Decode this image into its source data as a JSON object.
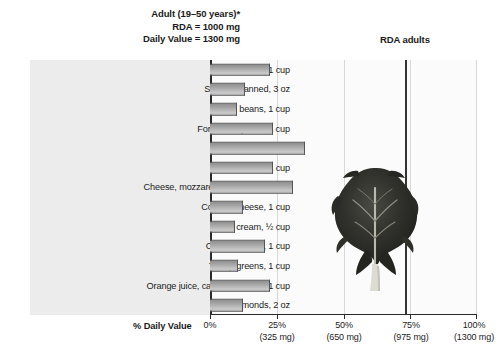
{
  "header": {
    "line1": "Adult (19–50 years)*",
    "line2": "RDA = 1000 mg",
    "line3": "Daily Value = 1300 mg",
    "rda_marker_label": "RDA adults"
  },
  "axis": {
    "title": "% Daily Value",
    "ticks": [
      {
        "pct": "0%",
        "mg": ""
      },
      {
        "pct": "25%",
        "mg": "(325 mg)"
      },
      {
        "pct": "50%",
        "mg": "(650 mg)"
      },
      {
        "pct": "75%",
        "mg": "(975 mg)"
      },
      {
        "pct": "100%",
        "mg": "(1300 mg)"
      }
    ]
  },
  "colors": {
    "label_panel": "#ececec",
    "plot_bg": "#fbfbfb",
    "axis": "#2b2b2b",
    "gridline": "#d8d8d8",
    "rda_line": "#333333",
    "bar_dark": "#8e8e8e",
    "bar_light": "#c9c9c9",
    "bar_outline": "#555555",
    "text": "#1c1c1c"
  },
  "image": {
    "greens_photo_alt": "leafy-greens-photo"
  },
  "chart_data": {
    "type": "bar",
    "xlabel": "% Daily Value",
    "ylabel": "",
    "orientation": "horizontal",
    "xlim": [
      0,
      100
    ],
    "xticks": [
      0,
      25,
      50,
      75,
      100
    ],
    "xtick_labels": [
      "0%",
      "25%",
      "50%",
      "75%",
      "100%"
    ],
    "xtick_sublabels": [
      "",
      "(325 mg)",
      "(650 mg)",
      "(975 mg)",
      "(1300 mg)"
    ],
    "grid": true,
    "legend": false,
    "daily_value_mg": 1300,
    "rda_mg": 1000,
    "rda_marker_pct": 76.9,
    "annotations": [
      "Adult (19–50 years)*",
      "RDA = 1000 mg",
      "Daily Value = 1300 mg",
      "RDA adults"
    ],
    "categories": [
      "Tofu, 1 cup",
      "Salmon, canned, 3 oz",
      "Baked beans, 1 cup",
      "Fortified soy milk, 1 cup",
      "Yogurt, plain, 1 cup",
      "Milk, 1 cup",
      "Cheese, mozzarella or Cheddar, 2 oz",
      "Cottage cheese, 1 cup",
      "Ice cream, ½ cup",
      "Collard greens, 1 cup",
      "Turnip greens, 1 cup",
      "Orange juice, calcium-fortified, 1 cup",
      "Almonds, 2 oz"
    ],
    "values": [
      22.5,
      13,
      10,
      23.5,
      35.5,
      23.5,
      31,
      12.5,
      9.5,
      20.5,
      10.5,
      22.5,
      12.5
    ]
  }
}
